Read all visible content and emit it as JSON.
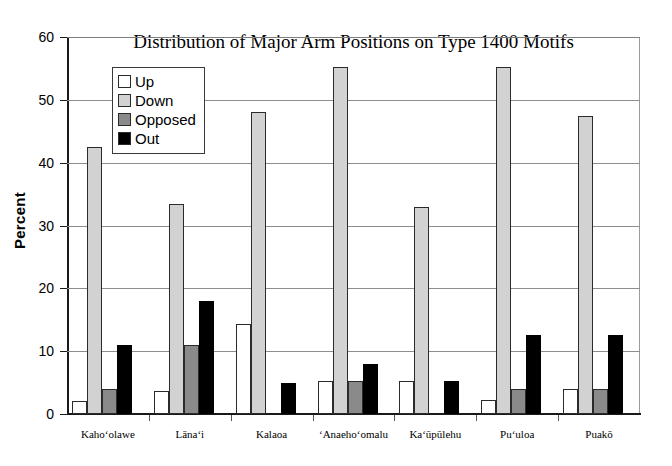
{
  "chart_data": {
    "type": "bar",
    "title": "Distribution of Major Arm Positions on Type 1400 Motifs",
    "xlabel": "",
    "ylabel": "Percent",
    "ylim": [
      0,
      60
    ],
    "ytick_step": 10,
    "yticks": [
      "0",
      "10",
      "20",
      "30",
      "40",
      "50",
      "60"
    ],
    "grid": "horizontal",
    "legend_position": "inside-top-left",
    "categories": [
      "Kahoʻolawe",
      "Lānaʻi",
      "Kalaoa",
      "ʻAnaehoʻomalu",
      "Kaʻūpūlehu",
      "Puʻuloa",
      "Puakō"
    ],
    "series": [
      {
        "name": "Up",
        "color": "#ffffff",
        "values": [
          2.0,
          3.7,
          14.3,
          5.2,
          5.2,
          2.3,
          4.0
        ]
      },
      {
        "name": "Down",
        "color": "#d2d2d2",
        "values": [
          42.5,
          33.5,
          48.0,
          55.3,
          33.0,
          55.2,
          47.5
        ]
      },
      {
        "name": "Opposed",
        "color": "#8a8a8a",
        "values": [
          4.0,
          11.0,
          0.0,
          5.2,
          0.0,
          4.0,
          4.0
        ]
      },
      {
        "name": "Out",
        "color": "#000000",
        "values": [
          11.0,
          18.0,
          5.0,
          8.0,
          5.3,
          12.5,
          12.5
        ]
      }
    ]
  },
  "axis": {
    "y_label": "Percent"
  },
  "colors": {
    "axis": "#1a1a1a",
    "grid": "#8d8d8d",
    "background": "#ffffff"
  }
}
